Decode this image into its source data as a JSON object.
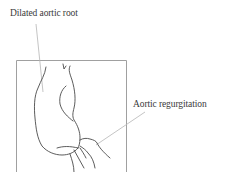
{
  "diagram": {
    "title": "",
    "labels": [
      {
        "id": "dilated-aortic-root",
        "text": "Dilated aortic root"
      },
      {
        "id": "aortic-regurgitation",
        "text": "Aortic regurgitation"
      }
    ],
    "colors": {
      "line_art": "#4a4a4a",
      "frame": "#9a9a9a",
      "leader": "#b5b5b5",
      "text": "#3a3a3a",
      "background": "#ffffff"
    }
  }
}
